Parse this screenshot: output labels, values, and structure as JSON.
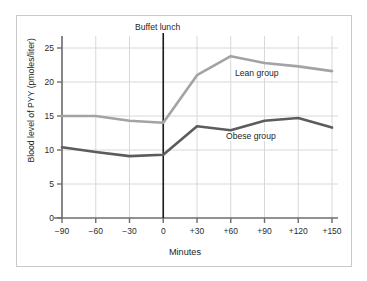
{
  "chart_data": {
    "type": "line",
    "title": "",
    "xlabel": "Minutes",
    "ylabel": "Blood level of PYY (pmoles/liter)",
    "x": [
      -90,
      -60,
      -30,
      0,
      30,
      60,
      90,
      120,
      150
    ],
    "x_tick_labels": [
      "−90",
      "−60",
      "−30",
      "0",
      "+30",
      "+60",
      "+90",
      "+120",
      "+150"
    ],
    "y_tick_labels": [
      "0",
      "5",
      "10",
      "15",
      "20",
      "25"
    ],
    "y_ticks": [
      0,
      5,
      10,
      15,
      20,
      25
    ],
    "xlim": [
      -90,
      150
    ],
    "ylim": [
      0,
      25
    ],
    "grid": true,
    "legend_position": "inline-labels",
    "series": [
      {
        "name": "Lean group",
        "color": "#a3a3a3",
        "values": [
          15.0,
          15.0,
          14.3,
          14.0,
          21.0,
          23.8,
          22.8,
          22.3,
          21.6
        ]
      },
      {
        "name": "Obese group",
        "color": "#5c5c5c",
        "values": [
          10.4,
          9.7,
          9.1,
          9.3,
          13.5,
          12.9,
          14.3,
          14.7,
          13.3
        ]
      }
    ],
    "annotations": [
      {
        "text": "Buffet lunch",
        "x": 0,
        "type": "vertical-line-label",
        "line_color": "#1a1a1a"
      }
    ],
    "colors": {
      "frame_border": "#c9c9c9",
      "axis": "#6e6e6e",
      "grid": "#d8d8d8",
      "background": "#ffffff",
      "text": "#1e1e1e"
    }
  }
}
